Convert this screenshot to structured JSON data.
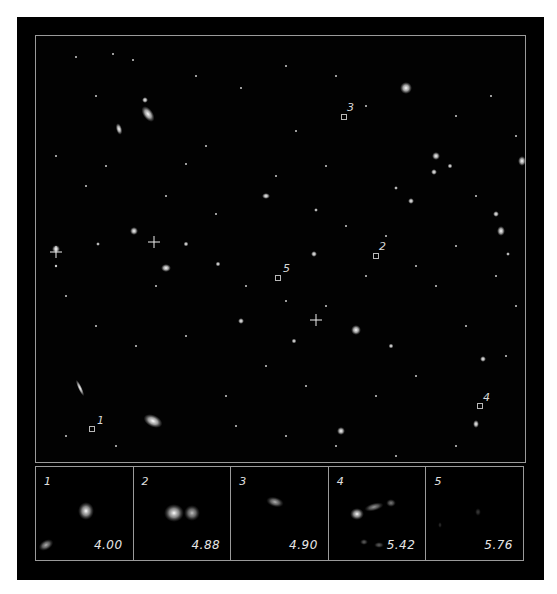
{
  "figure": {
    "colors": {
      "background": "#000000",
      "frame": "#9a9a9a",
      "text": "#e0e0e0",
      "page": "#ffffff"
    }
  },
  "markers": [
    {
      "label": "1",
      "x": 56,
      "y": 393
    },
    {
      "label": "2",
      "x": 340,
      "y": 220
    },
    {
      "label": "3",
      "x": 308,
      "y": 81
    },
    {
      "label": "4",
      "x": 444,
      "y": 370
    },
    {
      "label": "5",
      "x": 240,
      "y": 241
    }
  ],
  "thumbnails": [
    {
      "index": "1",
      "value": "4.00"
    },
    {
      "index": "2",
      "value": "4.88"
    },
    {
      "index": "3",
      "value": "4.90"
    },
    {
      "index": "4",
      "value": "5.42"
    },
    {
      "index": "5",
      "value": "5.76"
    }
  ]
}
